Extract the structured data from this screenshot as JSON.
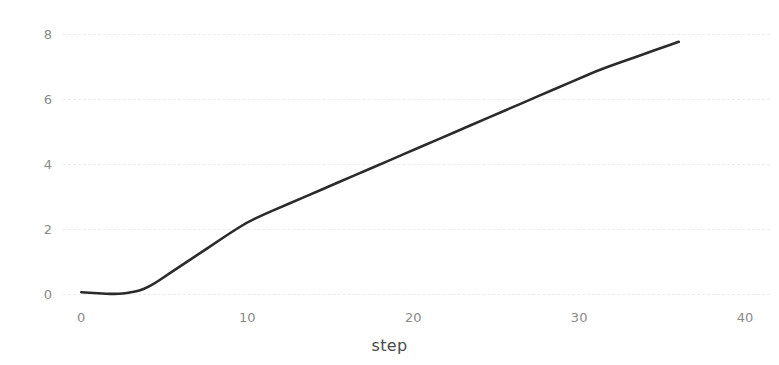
{
  "chart_data": {
    "type": "line",
    "title": "",
    "xlabel": "step",
    "ylabel": "",
    "xlim": [
      -1.1,
      41.5
    ],
    "ylim": [
      -0.25,
      8.05
    ],
    "xticks": [
      0,
      10,
      20,
      30,
      40
    ],
    "xtick_labels": [
      "0",
      "10",
      "20",
      "30",
      "40"
    ],
    "yticks": [
      0,
      2,
      4,
      6,
      8
    ],
    "ytick_labels": [
      "0",
      "2",
      "4",
      "6",
      "8"
    ],
    "grid": true,
    "grid_axis": "y",
    "grid_style": "dashed",
    "grid_color": "#ececec",
    "legend": false,
    "line_color": "#2b2b2b",
    "line_width": 2.6,
    "series": [
      {
        "name": "",
        "x": [
          0,
          0.5,
          1,
          1.5,
          2,
          2.5,
          3,
          3.5,
          4,
          4.5,
          5,
          6,
          7,
          8,
          9,
          10,
          11,
          12,
          13,
          14,
          15,
          16,
          17,
          18,
          19,
          20,
          21,
          22,
          23,
          24,
          25,
          26,
          27,
          28,
          29,
          30,
          31,
          32,
          33,
          34,
          35,
          36
        ],
        "y": [
          0.05,
          0.03,
          0.02,
          0.0,
          0.0,
          0.01,
          0.04,
          0.1,
          0.2,
          0.35,
          0.52,
          0.86,
          1.2,
          1.54,
          1.88,
          2.2,
          2.44,
          2.66,
          2.88,
          3.1,
          3.32,
          3.54,
          3.76,
          3.98,
          4.2,
          4.42,
          4.64,
          4.86,
          5.08,
          5.3,
          5.52,
          5.74,
          5.96,
          6.18,
          6.4,
          6.62,
          6.84,
          7.03,
          7.21,
          7.39,
          7.57,
          7.75
        ]
      }
    ]
  },
  "axes": {
    "x_label": "step",
    "y_label": ""
  }
}
